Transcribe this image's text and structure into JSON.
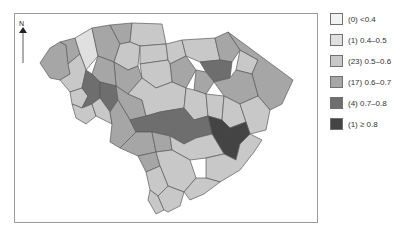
{
  "figure": {
    "compass": {
      "label": "N",
      "icon": "north-arrow-icon"
    },
    "map_subject": "South Carolina counties choropleth"
  },
  "legend": {
    "items": [
      {
        "count": "(0)",
        "range": "<0.4",
        "label": "(0) <0.4",
        "color": "#f2f2f2"
      },
      {
        "count": "(1)",
        "range": "0.4–0.5",
        "label": "(1) 0.4–0.5",
        "color": "#e0e0e0"
      },
      {
        "count": "(23)",
        "range": "0.5–0.6",
        "label": "(23) 0.5–0.6",
        "color": "#c8c8c8"
      },
      {
        "count": "(17)",
        "range": "0.6–0.7",
        "label": "(17) 0.6–0.7",
        "color": "#a6a6a6"
      },
      {
        "count": "(4)",
        "range": "0.7–0.8",
        "label": "(4) 0.7–0.8",
        "color": "#6e6e6e"
      },
      {
        "count": "(1)",
        "range": "≥ 0.8",
        "label": "(1) ≥ 0.8",
        "color": "#444444"
      }
    ]
  },
  "colors": {
    "frame": "#9a9a9a",
    "county_border": "#5a5a5a"
  }
}
